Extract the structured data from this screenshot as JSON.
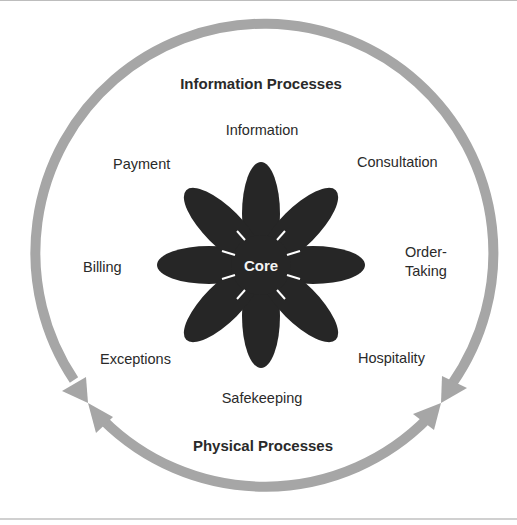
{
  "diagram": {
    "title_top": "Information Processes",
    "title_bottom": "Physical Processes",
    "center_label": "Core",
    "petals": [
      {
        "label": "Information",
        "position": "top"
      },
      {
        "label": "Consultation",
        "position": "top-right"
      },
      {
        "label": "Order-",
        "label_line2": "Taking",
        "position": "right"
      },
      {
        "label": "Hospitality",
        "position": "bottom-right"
      },
      {
        "label": "Safekeeping",
        "position": "bottom"
      },
      {
        "label": "Exceptions",
        "position": "bottom-left"
      },
      {
        "label": "Billing",
        "position": "left"
      },
      {
        "label": "Payment",
        "position": "top-left"
      }
    ],
    "colors": {
      "petal_fill": "#262626",
      "ring_arrow": "#a6a6a6",
      "text": "#2a2a2a",
      "core_text": "#f4f4f4"
    }
  }
}
